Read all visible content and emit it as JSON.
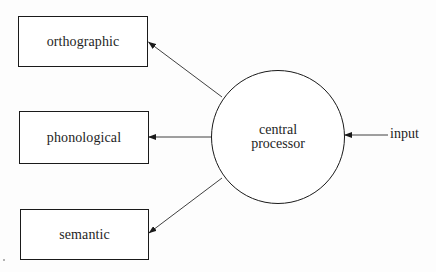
{
  "diagram": {
    "type": "flow",
    "nodes": {
      "orthographic": {
        "label": "orthographic",
        "shape": "rectangle"
      },
      "phonological": {
        "label": "phonological",
        "shape": "rectangle"
      },
      "semantic": {
        "label": "semantic",
        "shape": "rectangle"
      },
      "central_processor": {
        "label_line1": "central",
        "label_line2": "processor",
        "shape": "circle"
      },
      "input": {
        "label": "input",
        "shape": "text"
      }
    },
    "edges": [
      {
        "from": "input",
        "to": "central_processor"
      },
      {
        "from": "central_processor",
        "to": "orthographic"
      },
      {
        "from": "central_processor",
        "to": "phonological"
      },
      {
        "from": "central_processor",
        "to": "semantic"
      }
    ],
    "colors": {
      "stroke": "#1a1a1a",
      "background": "#ffffff"
    }
  }
}
